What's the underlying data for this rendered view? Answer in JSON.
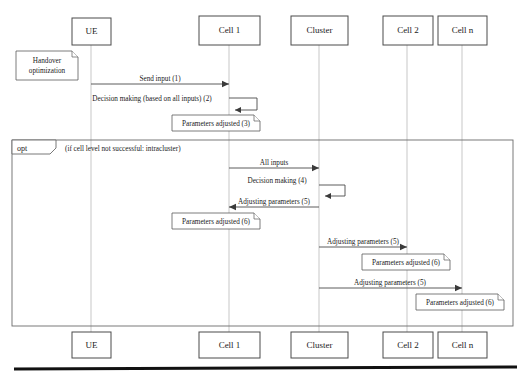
{
  "diagram": {
    "type": "uml-sequence-diagram",
    "title": "",
    "colors": {
      "background": "#ffffff",
      "line": "#4a4a4a",
      "lifeline": "#b9b9b9",
      "text": "#1a1a1a",
      "footer_rule": "#111111"
    },
    "lifelines": [
      {
        "id": "ue",
        "label": "UE",
        "x": 91,
        "box": {
          "x": 72,
          "y": 18,
          "w": 39,
          "h": 27
        }
      },
      {
        "id": "cell1",
        "label": "Cell 1",
        "x": 229,
        "box": {
          "x": 199,
          "y": 16,
          "w": 61,
          "h": 29
        }
      },
      {
        "id": "cluster",
        "label": "Cluster",
        "x": 319,
        "box": {
          "x": 291,
          "y": 16,
          "w": 57,
          "h": 29
        }
      },
      {
        "id": "cell2",
        "label": "Cell 2",
        "x": 407,
        "box": {
          "x": 383,
          "y": 16,
          "w": 50,
          "h": 29
        }
      },
      {
        "id": "celln",
        "label": "Cell n",
        "x": 462,
        "box": {
          "x": 438,
          "y": 16,
          "w": 49,
          "h": 29
        }
      }
    ],
    "bottom_lifelines": [
      {
        "id": "ue",
        "label": "UE",
        "box": {
          "x": 72,
          "y": 332,
          "w": 39,
          "h": 26
        }
      },
      {
        "id": "cell1",
        "label": "Cell 1",
        "box": {
          "x": 199,
          "y": 332,
          "w": 61,
          "h": 26
        }
      },
      {
        "id": "cluster",
        "label": "Cluster",
        "box": {
          "x": 291,
          "y": 332,
          "w": 57,
          "h": 26
        }
      },
      {
        "id": "cell2",
        "label": "Cell 2",
        "box": {
          "x": 383,
          "y": 332,
          "w": 50,
          "h": 26
        }
      },
      {
        "id": "celln",
        "label": "Cell n",
        "box": {
          "x": 438,
          "y": 332,
          "w": 49,
          "h": 26
        }
      }
    ],
    "notes": [
      {
        "id": "note-handover",
        "lines": [
          "Handover",
          "optimization"
        ],
        "box": {
          "x": 16,
          "y": 51,
          "w": 62,
          "h": 29
        }
      },
      {
        "id": "note-params-adjusted-3",
        "lines": [
          "Parameters adjusted (3)"
        ],
        "box": {
          "x": 172,
          "y": 115,
          "w": 88,
          "h": 16
        }
      },
      {
        "id": "note-params-adjusted-6-cell1",
        "lines": [
          "Parameters adjusted (6)"
        ],
        "box": {
          "x": 172,
          "y": 213,
          "w": 88,
          "h": 16
        }
      },
      {
        "id": "note-params-adjusted-6-cell2",
        "lines": [
          "Parameters adjusted (6)"
        ],
        "box": {
          "x": 362,
          "y": 254,
          "w": 88,
          "h": 16
        }
      },
      {
        "id": "note-params-adjusted-6-celln",
        "lines": [
          "Parameters adjusted (6)"
        ],
        "box": {
          "x": 416,
          "y": 294,
          "w": 88,
          "h": 16
        }
      }
    ],
    "fragment": {
      "id": "opt-fragment",
      "operator": "opt",
      "guard": "(if cell level not successful: intracluster)",
      "box": {
        "x": 12,
        "y": 140,
        "w": 501,
        "h": 186
      },
      "tag": {
        "w": 44,
        "h": 14,
        "notch": 6
      }
    },
    "messages": [
      {
        "id": "msg-1",
        "label": "Send input (1)",
        "from": "ue",
        "to": "cell1",
        "kind": "arrow",
        "direction": "right",
        "y": 84,
        "label_x": 160,
        "label_y": 81
      },
      {
        "id": "msg-2",
        "label": "Decision making (based on all inputs) (2)",
        "from": "cell1",
        "to": "cell1",
        "kind": "self",
        "y": 98,
        "loop_w": 28,
        "loop_h": 12,
        "label_x": 152,
        "label_y": 101
      },
      {
        "id": "msg-all-inputs",
        "label": "All inputs",
        "from": "cell1",
        "to": "cluster",
        "kind": "arrow",
        "direction": "right",
        "y": 168,
        "label_x": 274,
        "label_y": 165
      },
      {
        "id": "msg-4",
        "label": "Decision making (4)",
        "from": "cluster",
        "to": "cluster",
        "kind": "self",
        "y": 185,
        "loop_w": 26,
        "loop_h": 11,
        "label_x": 277,
        "label_y": 183
      },
      {
        "id": "msg-5-cell1",
        "label": "Adjusting parameters (5)",
        "from": "cluster",
        "to": "cell1",
        "kind": "arrow",
        "direction": "left",
        "y": 207,
        "label_x": 274,
        "label_y": 204
      },
      {
        "id": "msg-5-cell2",
        "label": "Adjusting parameters (5)",
        "from": "cluster",
        "to": "cell2",
        "kind": "arrow",
        "direction": "right",
        "y": 247,
        "label_x": 363,
        "label_y": 244
      },
      {
        "id": "msg-5-celln",
        "label": "Adjusting parameters (5)",
        "from": "cluster",
        "to": "celln",
        "kind": "arrow",
        "direction": "right",
        "y": 288,
        "label_x": 390,
        "label_y": 285
      }
    ],
    "footer_rule": {
      "x1": 14,
      "y1": 369,
      "x2": 517,
      "y2": 367
    }
  }
}
